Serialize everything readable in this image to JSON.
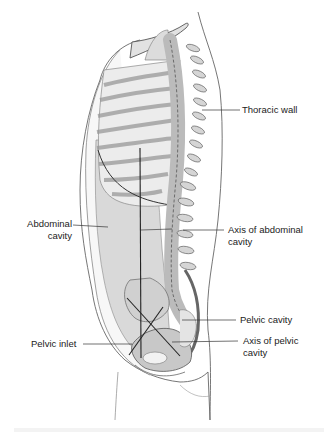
{
  "diagram": {
    "colors": {
      "outline": "#555555",
      "skin_fill": "#f7f7f7",
      "cavity_fill": "#d9d9d9",
      "bone_fill": "#e6e6e6",
      "bone_shadow": "#b5b5b5",
      "axis_line": "#222222",
      "label_text": "#222222"
    },
    "labels": {
      "thoracic_wall": "Thoracic wall",
      "abdominal_cavity_line1": "Abdominal",
      "abdominal_cavity_line2": "cavity",
      "axis_abdominal_line1": "Axis of abdominal",
      "axis_abdominal_line2": "cavity",
      "pelvic_cavity": "Pelvic cavity",
      "axis_pelvic_line1": "Axis of pelvic",
      "axis_pelvic_line2": "cavity",
      "pelvic_inlet": "Pelvic inlet"
    }
  }
}
